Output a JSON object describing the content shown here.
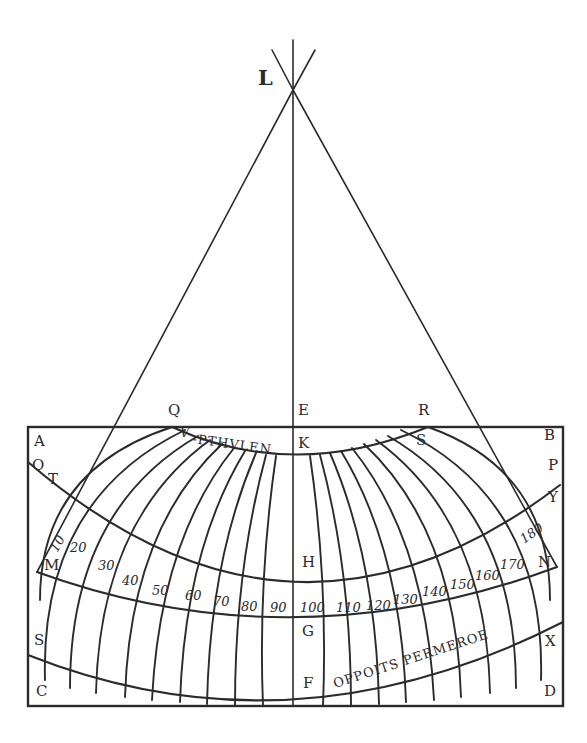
{
  "figure": {
    "ink_color": "#2b2b2b",
    "paper_color": "#ffffff"
  },
  "points": {
    "L": "L",
    "E": "E",
    "K": "K",
    "Q": "Q",
    "R": "R",
    "S_top": "S",
    "A": "A",
    "B": "B",
    "O": "O",
    "T": "T",
    "P": "P",
    "Y": "Y",
    "M": "M",
    "N": "N",
    "H": "H",
    "G": "G",
    "S": "S",
    "X": "X",
    "C": "C",
    "D": "D",
    "F": "F",
    "V": "V"
  },
  "inscriptions": {
    "north": "-PTHVLEN",
    "south": "OPPOITS PERMEROE"
  },
  "meridian_labels": [
    "10",
    "20",
    "30",
    "40",
    "50",
    "60",
    "70",
    "80",
    "90",
    "100",
    "110",
    "120",
    "130",
    "140",
    "150",
    "160",
    "170",
    "180"
  ]
}
